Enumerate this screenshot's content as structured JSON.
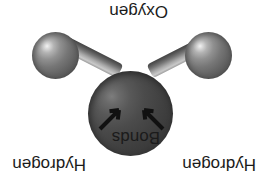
{
  "diagram": {
    "orientation": "upside-down (rotated 180 degrees)",
    "background_color": "#ffffff",
    "labels": {
      "oxygen": "Oxygen",
      "hydrogen_left": "Hydrogen",
      "hydrogen_right": "Hydrogen",
      "bonds": "Bonds"
    },
    "atoms": [
      {
        "name": "oxygen",
        "label": "Oxygen",
        "color": "#424242",
        "highlight_color": "#7d7d7d",
        "relative_size": "large"
      },
      {
        "name": "hydrogen-left",
        "label": "Hydrogen",
        "color": "#767676",
        "highlight_color": "#f2f2f2",
        "relative_size": "small"
      },
      {
        "name": "hydrogen-right",
        "label": "Hydrogen",
        "color": "#767676",
        "highlight_color": "#f2f2f2",
        "relative_size": "small"
      }
    ],
    "bonds": [
      {
        "name": "bond-left",
        "from": "oxygen",
        "to": "hydrogen-left",
        "color": "#9a9a9a"
      },
      {
        "name": "bond-right",
        "from": "oxygen",
        "to": "hydrogen-right",
        "color": "#9a9a9a"
      }
    ],
    "pointers": [
      {
        "name": "arrow-left",
        "points_to": "bond-left",
        "color": "#111111"
      },
      {
        "name": "arrow-right",
        "points_to": "bond-right",
        "color": "#111111"
      }
    ]
  }
}
